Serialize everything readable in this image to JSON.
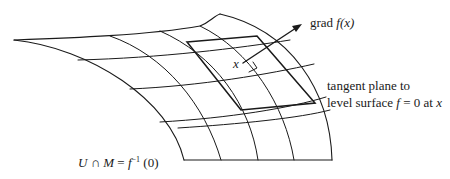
{
  "figure": {
    "labels": {
      "grad_prefix": "grad ",
      "grad_func": "f(x)",
      "point": "x",
      "tangent_line1": "tangent plane to",
      "tangent_line2_pre": "level surface ",
      "tangent_line2_f": "f",
      "tangent_line2_post": " = 0 at ",
      "tangent_line2_x": "x",
      "level_set_lhs": "U ∩ M",
      "level_set_eq": " = ",
      "level_set_f": "f",
      "level_set_sup": "−1",
      "level_set_arg": " (0)"
    },
    "colors": {
      "stroke": "#1a1a1a",
      "background": "#ffffff"
    }
  }
}
